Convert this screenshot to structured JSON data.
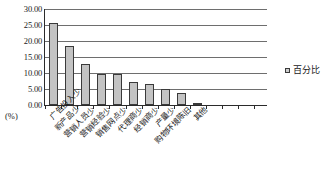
{
  "chart_data": {
    "type": "bar",
    "title": "",
    "xlabel": "",
    "ylabel": "(%)",
    "ylim": [
      0,
      30
    ],
    "ytick_step": 5,
    "grid": true,
    "legend_position": "right",
    "bar_color": "#c3c3c3",
    "bar_edge_color": "#3a3a3a",
    "ytick_labels": [
      "30.00",
      "25.00",
      "20.00",
      "15.00",
      "10.00",
      "5.00",
      "0.00"
    ],
    "categories": [
      "广告投入少",
      "新产品少",
      "营销人员少",
      "营销经验少",
      "销售网点少",
      "代理商少",
      "经销商少",
      "产量少",
      "购物环境陈旧",
      "其他"
    ],
    "series": [
      {
        "name": "百分比",
        "values": [
          25.5,
          18.4,
          12.8,
          9.7,
          9.7,
          7.1,
          6.5,
          5.1,
          3.8,
          0.5
        ]
      }
    ],
    "empty_tick_slots": 4
  },
  "legend": {
    "label": "百分比"
  },
  "axis": {
    "unit_label": "(%)"
  }
}
